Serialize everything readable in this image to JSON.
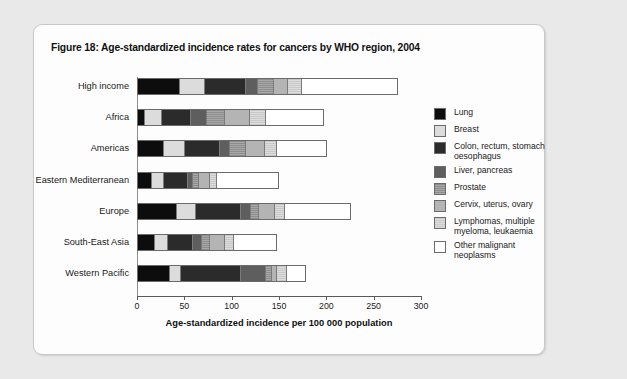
{
  "figure": {
    "title": "Figure 18: Age-standardized incidence rates for cancers by WHO region, 2004"
  },
  "chart_data": {
    "type": "bar",
    "orientation": "horizontal",
    "stacked": true,
    "title": "Figure 18: Age-standardized incidence rates for cancers by WHO region, 2004",
    "xlabel": "Age-standardized incidence per 100 000 population",
    "ylabel": "",
    "xlim": [
      0,
      300
    ],
    "xticks": [
      0,
      50,
      100,
      150,
      200,
      250,
      300
    ],
    "xtick_labels": [
      "0",
      "50",
      "100",
      "150",
      "200",
      "250",
      "300"
    ],
    "grid": false,
    "legend_position": "right",
    "categories": [
      "High income",
      "Africa",
      "Americas",
      "Eastern Mediterranean",
      "Europe",
      "South-East Asia",
      "Western Pacific"
    ],
    "series": [
      {
        "name": "Lung",
        "color": "#0d0d0d",
        "values": [
          44,
          6,
          27,
          14,
          41,
          17,
          33
        ]
      },
      {
        "name": "Breast",
        "color": "#dcdcdc",
        "values": [
          26,
          19,
          22,
          13,
          20,
          14,
          12
        ]
      },
      {
        "name": "Colon, rectum, stomach oesophagus",
        "color": "#2b2b2b",
        "values": [
          44,
          30,
          38,
          25,
          48,
          27,
          64
        ]
      },
      {
        "name": "Liver, pancreas",
        "color": "#5e5e5e",
        "values": [
          13,
          18,
          10,
          6,
          10,
          10,
          27
        ]
      },
      {
        "name": "Prostate",
        "color": "#9a9a9a",
        "values": [
          17,
          19,
          17,
          6,
          9,
          8,
          6
        ]
      },
      {
        "name": "Cervix, uterus, ovary",
        "color": "#b4b4b4",
        "values": [
          15,
          27,
          21,
          12,
          17,
          16,
          6
        ]
      },
      {
        "name": "Lymphomas, multiple myeloma, leukaemia",
        "color": "#d2d2d2",
        "values": [
          14,
          17,
          12,
          8,
          11,
          10,
          10
        ]
      },
      {
        "name": "Other malignant neoplasms",
        "color": "#ffffff",
        "values": [
          103,
          62,
          54,
          66,
          70,
          46,
          20
        ]
      }
    ],
    "totals": [
      276,
      198,
      201,
      150,
      226,
      148,
      178
    ]
  },
  "legend": {
    "items": [
      {
        "label": "Lung",
        "color": "#0d0d0d",
        "pattern": "solid"
      },
      {
        "label": "Breast",
        "color": "#dcdcdc",
        "pattern": "solid"
      },
      {
        "label": "Colon, rectum, stomach\noesophagus",
        "color": "#2b2b2b",
        "pattern": "solid"
      },
      {
        "label": "Liver, pancreas",
        "color": "#5e5e5e",
        "pattern": "solid"
      },
      {
        "label": "Prostate",
        "color": "#9a9a9a",
        "pattern": "hatch"
      },
      {
        "label": "Cervix, uterus, ovary",
        "color": "#b4b4b4",
        "pattern": "solid"
      },
      {
        "label": "Lymphomas, multiple\nmyeloma, leukaemia",
        "color": "#d2d2d2",
        "pattern": "hatch"
      },
      {
        "label": "Other malignant neoplasms",
        "color": "#ffffff",
        "pattern": "solid"
      }
    ]
  }
}
